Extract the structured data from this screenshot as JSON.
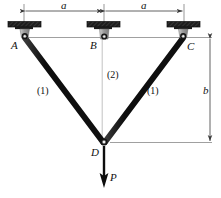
{
  "figure": {
    "type": "truss-diagram",
    "joints": [
      {
        "id": "A",
        "label": "A",
        "x": 24,
        "y": 37,
        "support": true
      },
      {
        "id": "B",
        "label": "B",
        "x": 104,
        "y": 37,
        "support": true
      },
      {
        "id": "C",
        "label": "C",
        "x": 184,
        "y": 37,
        "support": true
      },
      {
        "id": "D",
        "label": "D",
        "x": 104,
        "y": 142,
        "support": false
      }
    ],
    "members": [
      {
        "from": "A",
        "to": "D",
        "label": "(1)",
        "color": "#111111",
        "style": "thick-black"
      },
      {
        "from": "B",
        "to": "D",
        "label": "(2)",
        "color": "#8c8c8c",
        "style": "thin-gray"
      },
      {
        "from": "C",
        "to": "D",
        "label": "(1)",
        "color": "#111111",
        "style": "thick-black"
      }
    ],
    "member_labels": [
      {
        "text": "(1)",
        "x": 39,
        "y": 92
      },
      {
        "text": "(2)",
        "x": 108,
        "y": 76
      },
      {
        "text": "(1)",
        "x": 148,
        "y": 92
      }
    ],
    "point_labels": [
      {
        "text": "A",
        "x": 12,
        "y": 44
      },
      {
        "text": "B",
        "x": 91,
        "y": 44
      },
      {
        "text": "C",
        "x": 187,
        "y": 45
      },
      {
        "text": "D",
        "x": 92,
        "y": 153
      }
    ],
    "dimensions": [
      {
        "name": "a-left",
        "text": "a",
        "orientation": "horizontal",
        "x": 62,
        "y": 4,
        "from_x": 24,
        "to_x": 104,
        "line_y": 11
      },
      {
        "name": "a-right",
        "text": "a",
        "orientation": "horizontal",
        "x": 142,
        "y": 4,
        "from_x": 104,
        "to_x": 184,
        "line_y": 11
      },
      {
        "name": "b-vertical",
        "text": "b",
        "orientation": "vertical",
        "x": 203,
        "y": 90,
        "from_y": 40,
        "to_y": 142,
        "line_x": 210
      }
    ],
    "load": {
      "label": "P",
      "direction": "down",
      "arrow_from_x": 104,
      "arrow_from_y": 146,
      "arrow_to_y": 186,
      "label_x": 110,
      "label_y": 177
    },
    "colors": {
      "member_dark": "#111111",
      "member_gray": "#8c8c8c",
      "support_plate": "#1a1a1a",
      "support_bracket": "#9a9a9a",
      "dimension_line": "#555555",
      "extension_line": "#555555",
      "background": "#ffffff",
      "pin_fill": "#e8e8e8"
    }
  }
}
